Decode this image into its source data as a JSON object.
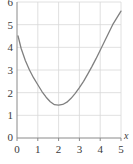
{
  "chart_data": {
    "type": "line",
    "title": "",
    "subtitle": "",
    "xlabel": "x",
    "ylabel": "",
    "xlim": [
      0,
      5
    ],
    "ylim": [
      0,
      6
    ],
    "grid": true,
    "legend": null,
    "legend_position": "none",
    "xticks": [
      "0",
      "1",
      "2",
      "3",
      "4",
      "5"
    ],
    "xtick_values": [
      0,
      1,
      2,
      3,
      4,
      5
    ],
    "yticks": [
      "0",
      "1",
      "2",
      "3",
      "4",
      "5",
      "6"
    ],
    "ytick_values": [
      0,
      1,
      2,
      3,
      4,
      5,
      6
    ],
    "series": [
      {
        "name": "curve",
        "color": "#808080",
        "x": [
          0.05,
          0.2,
          0.4,
          0.6,
          0.8,
          1.0,
          1.2,
          1.4,
          1.6,
          1.8,
          2.0,
          2.2,
          2.4,
          2.6,
          2.8,
          3.0,
          3.2,
          3.4,
          3.6,
          3.8,
          4.0,
          4.2,
          4.4,
          4.6,
          4.8,
          5.0
        ],
        "y": [
          4.5,
          3.95,
          3.42,
          3.0,
          2.65,
          2.35,
          2.05,
          1.8,
          1.6,
          1.47,
          1.45,
          1.48,
          1.58,
          1.75,
          1.97,
          2.22,
          2.5,
          2.82,
          3.15,
          3.5,
          3.87,
          4.25,
          4.62,
          5.0,
          5.3,
          5.6
        ]
      }
    ],
    "annotations": [],
    "minimum_point": {
      "x": 1.9,
      "y": 1.45
    },
    "colors": {
      "curve": "#808080",
      "grid": "#d8d8d8",
      "axis": "#8a8a8a",
      "text": "#3a3a3a",
      "background": "#ffffff"
    }
  }
}
